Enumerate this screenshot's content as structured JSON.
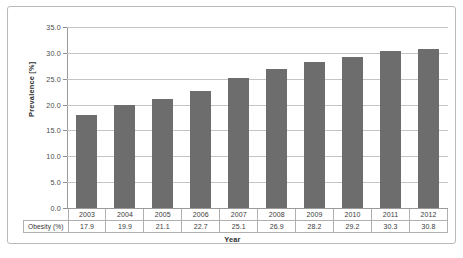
{
  "chart_data": {
    "type": "bar",
    "title": "",
    "xlabel": "Year",
    "ylabel": "Prevalence [%]",
    "categories": [
      "2003",
      "2004",
      "2005",
      "2006",
      "2007",
      "2008",
      "2009",
      "2010",
      "2011",
      "2012"
    ],
    "values": [
      17.9,
      19.9,
      21.1,
      22.7,
      25.1,
      26.9,
      28.2,
      29.2,
      30.3,
      30.8
    ],
    "series": [
      {
        "name": "Obesity (%)",
        "values": [
          17.9,
          19.9,
          21.1,
          22.7,
          25.1,
          26.9,
          28.2,
          29.2,
          30.3,
          30.8
        ]
      }
    ],
    "ylim": [
      0.0,
      35.0
    ],
    "ytick_labels": [
      "0.0",
      "5.0",
      "10.0",
      "15.0",
      "20.0",
      "25.0",
      "30.0",
      "35.0"
    ],
    "ytick_values": [
      0.0,
      5.0,
      10.0,
      15.0,
      20.0,
      25.0,
      30.0,
      35.0
    ],
    "grid": true,
    "legend": false,
    "bar_color": "#6d6d6d",
    "gridline_color": "#c4c4c4",
    "axis_color": "#9a9a9a"
  },
  "table": {
    "row_header": "Obesity (%)",
    "year_row": [
      "2003",
      "2004",
      "2005",
      "2006",
      "2007",
      "2008",
      "2009",
      "2010",
      "2011",
      "2012"
    ],
    "value_row": [
      "17.9",
      "19.9",
      "21.1",
      "22.7",
      "25.1",
      "26.9",
      "28.2",
      "29.2",
      "30.3",
      "30.8"
    ]
  }
}
